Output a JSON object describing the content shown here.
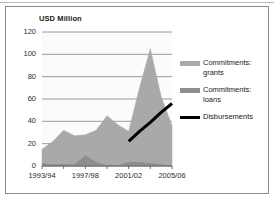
{
  "chart_data": {
    "type": "area",
    "title": "",
    "axis_unit_label": "USD Million",
    "xlabel": "",
    "ylabel": "USD Million",
    "ylim": [
      0,
      120
    ],
    "yticks": [
      0,
      20,
      40,
      60,
      80,
      100,
      120
    ],
    "grid": true,
    "legend_position": "right",
    "stacked": true,
    "x": [
      "1993/94",
      "1994/95",
      "1995/96",
      "1996/97",
      "1997/98",
      "1998/99",
      "1999/00",
      "2000/01",
      "2001/02",
      "2002/03",
      "2003/04",
      "2004/05",
      "2005/06"
    ],
    "xtick_labels": [
      "1993/94",
      "1997/98",
      "2001/02",
      "2005/06"
    ],
    "xtick_indices": [
      0,
      4,
      8,
      12
    ],
    "series": [
      {
        "name": "Commitments: loans",
        "color": "#8e8e8e",
        "kind": "area",
        "values": [
          3,
          2,
          2,
          2,
          10,
          4,
          1,
          1,
          4,
          4,
          3,
          2,
          1
        ]
      },
      {
        "name": "Commitments: grants",
        "color": "#a9a9a9",
        "kind": "area",
        "values": [
          12,
          20,
          30,
          25,
          18,
          28,
          44,
          36,
          27,
          66,
          102,
          60,
          35
        ]
      },
      {
        "name": "Disbursements",
        "color": "#000000",
        "kind": "line",
        "start_index": 8,
        "values": [
          null,
          null,
          null,
          null,
          null,
          null,
          null,
          null,
          22,
          31,
          39,
          48,
          56
        ]
      }
    ],
    "totals_note": "Areas are stacked: loans at base, grants above."
  },
  "legend": {
    "items": [
      {
        "label": "Commitments:\ngrants",
        "swatch_color": "#a9a9a9",
        "swatch_type": "area"
      },
      {
        "label": "Commitments:\nloans",
        "swatch_color": "#8e8e8e",
        "swatch_type": "area"
      },
      {
        "label": "Disbursements",
        "swatch_color": "#000000",
        "swatch_type": "line"
      }
    ]
  },
  "colors": {
    "grants": "#a9a9a9",
    "loans": "#8e8e8e",
    "disbursements": "#000000",
    "gridline": "#9a9a9a",
    "axis": "#6d6d6d",
    "frame": "#8a8a8a",
    "plot_background": "#fbfbfb",
    "text": "#1a1a1a"
  }
}
